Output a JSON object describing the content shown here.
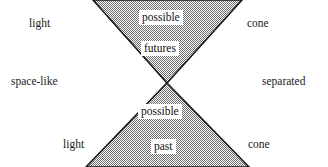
{
  "figure": {
    "type": "light-cone-diagram",
    "width": 328,
    "height": 167,
    "background_color": "#ffffff"
  },
  "colors": {
    "cone_fill": "#9a9a9a",
    "cone_edge": "#1a1a1a",
    "text": "#111111",
    "label_box_background": "#ffffff"
  },
  "geometry": {
    "vertex_x": 167,
    "vertex_y": 83,
    "future_cone": {
      "top_left_x": 93,
      "top_right_x": 242,
      "top_y": 0
    },
    "past_cone": {
      "bottom_left_x": 86,
      "bottom_right_x": 249,
      "bottom_y": 167
    }
  },
  "labels": {
    "light_top": "light",
    "cone_top": "cone",
    "space_like": "space-like",
    "separated": "separated",
    "light_bottom": "light",
    "cone_bottom": "cone"
  },
  "region_labels": {
    "possible_future": "possible",
    "futures": "futures",
    "possible_past": "possible",
    "past": "past"
  }
}
